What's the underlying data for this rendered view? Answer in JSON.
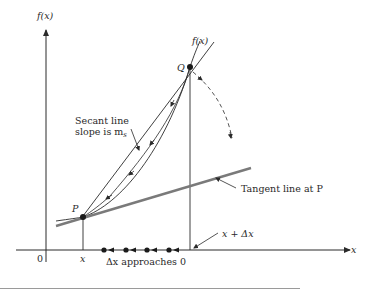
{
  "diagram": {
    "labels": {
      "y_axis": "f(x)",
      "x_axis": "x",
      "origin": "0",
      "curve": "f(x)",
      "point_p": "P",
      "point_q": "Q",
      "x_tick": "x",
      "x_plus_dx": "x + Δx",
      "secant_line_1": "Secant line",
      "secant_line_2_prefix": "slope is m",
      "secant_line_2_sub": "s",
      "tangent_line": "Tangent line at P",
      "dx_approaches": "Δx approaches 0"
    },
    "colors": {
      "ink": "#2a2a2a",
      "tangent": "#7a7a7a",
      "separator": "#9a9a9a"
    }
  }
}
